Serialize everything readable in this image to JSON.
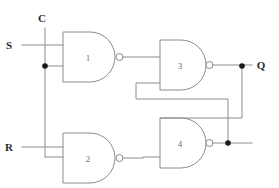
{
  "diagram": {
    "canvas": {
      "width": 279,
      "height": 188,
      "background": "#ffffff"
    },
    "colors": {
      "wire": "#8c8c8c",
      "gate_outline": "#8c8c8c",
      "junction": "#1a1a1a",
      "label_text": "#2b2b2b",
      "gate_number_text": "#6e6e6e"
    },
    "inputs": [
      {
        "id": "input-c",
        "label": "C",
        "x": 42,
        "y": 22
      },
      {
        "id": "input-s",
        "label": "S",
        "x": 9,
        "y": 43
      },
      {
        "id": "input-r",
        "label": "R",
        "x": 9,
        "y": 151
      }
    ],
    "outputs": [
      {
        "id": "output-q",
        "label": "Q",
        "x": 259,
        "y": 70
      }
    ],
    "gates": [
      {
        "id": "gate-1",
        "label": "1",
        "type": "nand",
        "x": 63,
        "y": 32,
        "w": 55,
        "h": 50,
        "label_x": 88,
        "label_y": 61
      },
      {
        "id": "gate-2",
        "label": "2",
        "type": "nand",
        "x": 63,
        "y": 133,
        "w": 55,
        "h": 50,
        "label_x": 88,
        "label_y": 162
      },
      {
        "id": "gate-3",
        "label": "3",
        "type": "nand",
        "x": 160,
        "y": 40,
        "w": 46,
        "h": 50,
        "label_x": 180,
        "label_y": 69
      },
      {
        "id": "gate-4",
        "label": "4",
        "type": "nand",
        "x": 160,
        "y": 118,
        "w": 46,
        "h": 50,
        "label_x": 180,
        "label_y": 147
      }
    ],
    "junctions": [
      {
        "id": "junction-c-gate1",
        "x": 45,
        "y": 66
      },
      {
        "id": "junction-q-output",
        "x": 242,
        "y": 66
      },
      {
        "id": "junction-gate4-output",
        "x": 228,
        "y": 144
      }
    ]
  }
}
